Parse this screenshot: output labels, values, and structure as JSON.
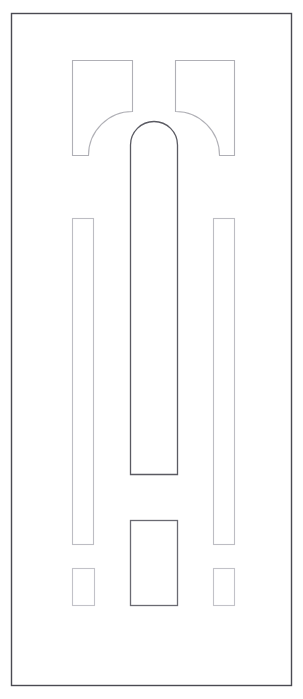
{
  "drawing": {
    "title": "Door Panel Elevation",
    "type": "line-drawing",
    "units": "px",
    "canvas": {
      "width": 303,
      "height": 699
    },
    "background_color": "#ffffff",
    "stroke_colors": {
      "outer_frame": "#4a4a52",
      "arch_panel": "#5a5a62",
      "bottom_center_panel": "#6a6a72",
      "corner_panel": "#b0b0b6",
      "side_panel": "#bdbdc3",
      "small_square": "#c2c2c8"
    },
    "outer_frame": {
      "label": "Door Outer Frame",
      "x": 11,
      "y": 13,
      "width": 281,
      "height": 673
    },
    "shapes": [
      {
        "name": "top-left-corner-panel",
        "label": "Top Left Corner Panel",
        "kind": "quarter-round-notch",
        "x": 72,
        "y": 60,
        "width": 61,
        "height": 96,
        "corner_radius": 44,
        "notch_corner": "bottom-right"
      },
      {
        "name": "top-right-corner-panel",
        "label": "Top Right Corner Panel",
        "kind": "quarter-round-notch",
        "x": 175,
        "y": 60,
        "width": 60,
        "height": 96,
        "corner_radius": 44,
        "notch_corner": "bottom-left"
      },
      {
        "name": "center-arch-panel",
        "label": "Center Arched Panel",
        "kind": "arch",
        "x": 130,
        "y": 121,
        "width": 48,
        "height": 354,
        "arch_radius": 24
      },
      {
        "name": "left-side-panel",
        "label": "Left Vertical Stile Panel",
        "kind": "rectangle",
        "x": 72,
        "y": 218,
        "width": 22,
        "height": 327
      },
      {
        "name": "right-side-panel",
        "label": "Right Vertical Stile Panel",
        "kind": "rectangle",
        "x": 213,
        "y": 218,
        "width": 22,
        "height": 327
      },
      {
        "name": "bottom-center-panel",
        "label": "Bottom Center Panel",
        "kind": "rectangle",
        "x": 130,
        "y": 520,
        "width": 48,
        "height": 86
      },
      {
        "name": "bottom-left-square",
        "label": "Bottom Left Square Panel",
        "kind": "rectangle",
        "x": 72,
        "y": 568,
        "width": 23,
        "height": 38
      },
      {
        "name": "bottom-right-square",
        "label": "Bottom Right Square Panel",
        "kind": "rectangle",
        "x": 213,
        "y": 568,
        "width": 22,
        "height": 38
      }
    ]
  }
}
